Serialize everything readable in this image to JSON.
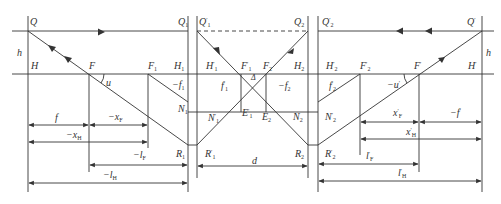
{
  "figure": {
    "type": "optical-diagram",
    "caption": "",
    "colors": {
      "line": "#333333",
      "background": "#ffffff"
    }
  },
  "labels": {
    "Q": "Q",
    "Q1": "Q",
    "Q1p": "Q",
    "Q2": "Q",
    "Q2p": "Q",
    "Qp": "Q",
    "h_left": "h",
    "h_right": "h",
    "H": "H",
    "F": "F",
    "u": "u",
    "F1": "F",
    "H1": "H",
    "H1p": "H",
    "F1p": "F",
    "F2": "F",
    "H2": "H",
    "H2p": "H",
    "F2p": "F",
    "Fp": "F",
    "Hp": "H",
    "neg_f1": "−f",
    "f1p": "f",
    "delta": "Δ",
    "neg_f2": "−f",
    "f2p": "f",
    "neg_up": "−u",
    "N1": "N",
    "N1p": "N",
    "E1p": "E",
    "E2": "E",
    "N2": "N",
    "N2p": "N",
    "R1": "R",
    "R1p": "R",
    "R2": "R",
    "R2p": "R",
    "f": "f",
    "neg_xF": "−x",
    "neg_xH": "−x",
    "neg_lF": "−l",
    "neg_lH": "−l",
    "d": "d",
    "xFp_top": "x",
    "neg_fp": "−f",
    "xHp": "x",
    "lFp": "l",
    "lHp": "l"
  },
  "subs": {
    "one": "1",
    "two": "2",
    "F": "F",
    "H": "H",
    "prime": "′"
  },
  "dimensions": [
    {
      "name": "f",
      "from": "H",
      "to": "F"
    },
    {
      "name": "-x_F",
      "from": "F",
      "to": "F1"
    },
    {
      "name": "-x_H",
      "from": "H",
      "to": "F1"
    },
    {
      "name": "-l_F",
      "from": "F",
      "to": "H1"
    },
    {
      "name": "-l_H",
      "from": "H",
      "to": "H1"
    },
    {
      "name": "d",
      "from": "H1'",
      "to": "H2"
    },
    {
      "name": "x'_F",
      "from": "F2'",
      "to": "F'"
    },
    {
      "name": "-f'",
      "from": "F'",
      "to": "H'"
    },
    {
      "name": "x'_H",
      "from": "F2'",
      "to": "H'"
    },
    {
      "name": "l'_F",
      "from": "H2'",
      "to": "F'"
    },
    {
      "name": "l'_H",
      "from": "H2'",
      "to": "H'"
    }
  ]
}
